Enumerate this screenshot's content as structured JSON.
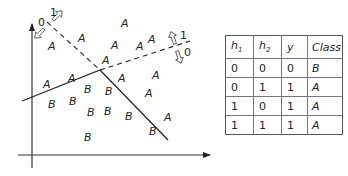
{
  "diagram": {
    "region_labels": {
      "class_a": "A",
      "class_b": "B"
    },
    "half_plane_markers": {
      "line1": {
        "positive": "1",
        "negative": "0"
      },
      "line2": {
        "positive": "1",
        "negative": "0"
      }
    },
    "points_a": [
      {
        "x": 48,
        "y": 50
      },
      {
        "x": 78,
        "y": 42
      },
      {
        "x": 121,
        "y": 27
      },
      {
        "x": 111,
        "y": 49
      },
      {
        "x": 136,
        "y": 50
      },
      {
        "x": 148,
        "y": 43
      },
      {
        "x": 102,
        "y": 64
      },
      {
        "x": 68,
        "y": 82
      },
      {
        "x": 43,
        "y": 88
      },
      {
        "x": 118,
        "y": 82
      },
      {
        "x": 152,
        "y": 79
      },
      {
        "x": 145,
        "y": 97
      },
      {
        "x": 164,
        "y": 121
      }
    ],
    "points_b": [
      {
        "x": 84,
        "y": 93
      },
      {
        "x": 105,
        "y": 95
      },
      {
        "x": 48,
        "y": 108
      },
      {
        "x": 69,
        "y": 105
      },
      {
        "x": 87,
        "y": 116
      },
      {
        "x": 104,
        "y": 115
      },
      {
        "x": 125,
        "y": 120
      },
      {
        "x": 149,
        "y": 135
      },
      {
        "x": 84,
        "y": 141
      }
    ]
  },
  "table": {
    "headers": [
      {
        "base": "h",
        "sub": "1"
      },
      {
        "base": "h",
        "sub": "2"
      },
      {
        "base": "y",
        "sub": ""
      },
      {
        "base": "Class",
        "sub": ""
      }
    ],
    "rows": [
      [
        "0",
        "0",
        "0",
        "B"
      ],
      [
        "0",
        "1",
        "1",
        "A"
      ],
      [
        "1",
        "0",
        "1",
        "A"
      ],
      [
        "1",
        "1",
        "1",
        "A"
      ]
    ]
  }
}
